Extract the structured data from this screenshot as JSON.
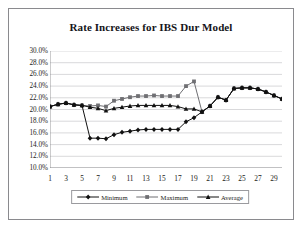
{
  "title": "Rate Increases for IBS Dur Model",
  "legend": {
    "position": "bottom",
    "items": [
      {
        "label": "Minimum",
        "marker": "diamond",
        "color": "#111111"
      },
      {
        "label": "Maximum",
        "marker": "square",
        "color": "#6f6f73"
      },
      {
        "label": "Average",
        "marker": "triangle",
        "color": "#111111"
      }
    ]
  },
  "axis": {
    "y_ticks": [
      "30.0%",
      "28.0%",
      "26.0%",
      "24.0%",
      "22.0%",
      "20.0%",
      "18.0%",
      "16.0%",
      "14.0%",
      "12.0%",
      "10.0%"
    ],
    "x_ticks": [
      "1",
      "3",
      "5",
      "7",
      "9",
      "11",
      "13",
      "15",
      "17",
      "19",
      "21",
      "23",
      "25",
      "27",
      "29"
    ]
  },
  "chart_data": {
    "type": "line",
    "title": "Rate Increases for IBS Dur Model",
    "xlabel": "",
    "ylabel": "",
    "ylim": [
      10,
      30
    ],
    "ytick_step": 2,
    "ytick_format": "percent",
    "xlim": [
      1,
      30
    ],
    "grid": "horizontal",
    "legend_position": "bottom",
    "x": [
      1,
      2,
      3,
      4,
      5,
      6,
      7,
      8,
      9,
      10,
      11,
      12,
      13,
      14,
      15,
      16,
      17,
      18,
      19,
      20,
      21,
      22,
      23,
      24,
      25,
      26,
      27,
      28,
      29,
      30
    ],
    "series": [
      {
        "name": "Minimum",
        "marker": "diamond",
        "color": "#111111",
        "values": [
          20.5,
          20.9,
          21.1,
          20.8,
          20.7,
          15.1,
          15.1,
          15.0,
          15.7,
          16.1,
          16.3,
          16.5,
          16.6,
          16.6,
          16.6,
          16.6,
          16.6,
          17.9,
          18.6,
          19.6,
          20.6,
          22.1,
          21.6,
          23.6,
          23.7,
          23.7,
          23.5,
          23.0,
          22.4,
          21.8
        ]
      },
      {
        "name": "Maximum",
        "marker": "square",
        "color": "#6f6f73",
        "values": [
          20.5,
          20.9,
          21.1,
          20.8,
          20.7,
          20.6,
          20.7,
          20.5,
          21.5,
          21.8,
          22.1,
          22.3,
          22.3,
          22.4,
          22.3,
          22.3,
          22.3,
          24.0,
          24.8,
          19.6,
          20.6,
          22.1,
          21.6,
          23.6,
          23.7,
          23.7,
          23.5,
          23.0,
          22.4,
          21.8
        ]
      },
      {
        "name": "Average",
        "marker": "triangle",
        "color": "#111111",
        "values": [
          20.5,
          20.9,
          21.1,
          20.8,
          20.7,
          20.4,
          20.2,
          19.8,
          20.2,
          20.4,
          20.6,
          20.7,
          20.7,
          20.7,
          20.7,
          20.7,
          20.5,
          20.1,
          20.1,
          19.6,
          20.6,
          22.1,
          21.6,
          23.6,
          23.7,
          23.7,
          23.5,
          23.0,
          22.4,
          21.8
        ]
      }
    ]
  }
}
